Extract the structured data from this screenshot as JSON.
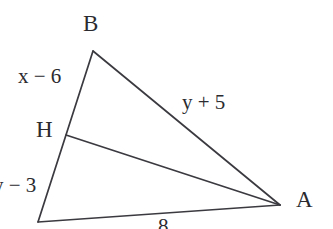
{
  "figure": {
    "type": "geometry-diagram",
    "background_color": "#ffffff",
    "stroke_color": "#3a3a40",
    "text_color": "#2b2b2f",
    "vertices": {
      "b": {
        "label": "B",
        "x": 93,
        "y": 51
      },
      "a": {
        "label": "A",
        "x": 280,
        "y": 205
      },
      "c": {
        "label": "",
        "x": 38,
        "y": 222
      },
      "h": {
        "label": "H",
        "x": 66,
        "y": 135
      }
    },
    "segments": [
      {
        "name": "side-b-to-c",
        "from": "b",
        "to": "c"
      },
      {
        "name": "side-b-to-a",
        "from": "b",
        "to": "a"
      },
      {
        "name": "side-c-to-a",
        "from": "c",
        "to": "a"
      },
      {
        "name": "cevian-h-to-a",
        "from": "h",
        "to": "a"
      }
    ],
    "labels": {
      "vertex_b": "B",
      "vertex_a": "A",
      "point_h": "H",
      "side_bh": "x − 6",
      "side_hc": "y − 3",
      "side_ba": "y + 5",
      "side_ca": "8"
    }
  }
}
